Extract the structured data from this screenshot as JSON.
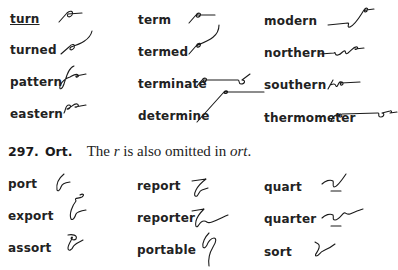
{
  "section_top": {
    "columns": [
      {
        "words": [
          "turn",
          "turned",
          "pattern",
          "eastern"
        ]
      },
      {
        "words": [
          "term",
          "termed",
          "terminate",
          "determine"
        ]
      },
      {
        "words": [
          "modern",
          "northern",
          "southern",
          "thermometer"
        ]
      }
    ],
    "underlined_word": "turn"
  },
  "section_ort": {
    "number": "297.",
    "title": "Ort.",
    "text_before": "The",
    "text_letter": "r",
    "text_middle": "is also omitted in",
    "text_suffix": "ort",
    "text_end": ".",
    "columns": [
      {
        "words": [
          "port",
          "export",
          "assort"
        ]
      },
      {
        "words": [
          "report",
          "reporter",
          "portable"
        ]
      },
      {
        "words": [
          "quart",
          "quarter",
          "sort"
        ]
      }
    ]
  }
}
